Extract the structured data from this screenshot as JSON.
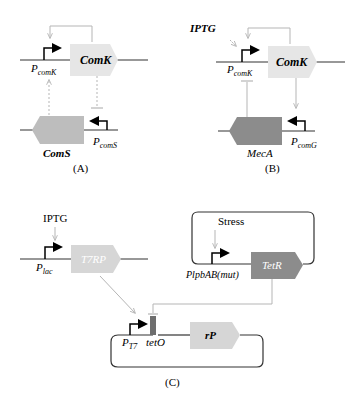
{
  "panels": {
    "A": {
      "caption": "(A)",
      "genes": {
        "comK": "ComK",
        "comS": "ComS"
      },
      "promoters": {
        "pcomK_main": "P",
        "pcomK_sub": "comK",
        "pcomS_main": "P",
        "pcomS_sub": "comS"
      }
    },
    "B": {
      "caption": "(B)",
      "inducer": "IPTG",
      "genes": {
        "comK": "ComK",
        "mecA": "MecA"
      },
      "promoters": {
        "pcomK_main": "P",
        "pcomK_sub": "comK",
        "pcomG_main": "P",
        "pcomG_sub": "comG"
      }
    },
    "C": {
      "caption": "(C)",
      "inducer": "IPTG",
      "signal": "Stress",
      "genes": {
        "t7rp": "T7RP",
        "tetR": "TetR",
        "rP": "rP"
      },
      "promoters": {
        "plac_main": "P",
        "plac_sub": "lac",
        "plpbab": "PlpbAB(mut)",
        "pt7_main": "P",
        "pt7_sub": "T7"
      },
      "operator": "tetO"
    }
  },
  "colors": {
    "light_gene": "#e6e6e6",
    "mid_gene": "#bdbdbd",
    "dark_gene": "#8c8c8c",
    "arrow_gray": "#b5b5b5",
    "line": "#333333",
    "promoter": "#000000"
  }
}
